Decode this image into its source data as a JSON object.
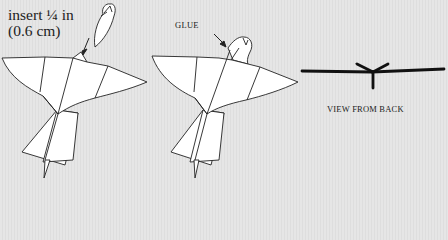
{
  "figure": {
    "panels": [
      {
        "id": "step-insert",
        "annotation_line1": "insert ¼ in",
        "annotation_line2": "(0.6 cm)"
      },
      {
        "id": "step-glue",
        "annotation": "GLUE"
      },
      {
        "id": "view-from-back",
        "caption": "VIEW FROM BACK"
      }
    ],
    "colors": {
      "background": "#e4e4e4",
      "paper": "#ffffff",
      "line": "#222222"
    }
  }
}
